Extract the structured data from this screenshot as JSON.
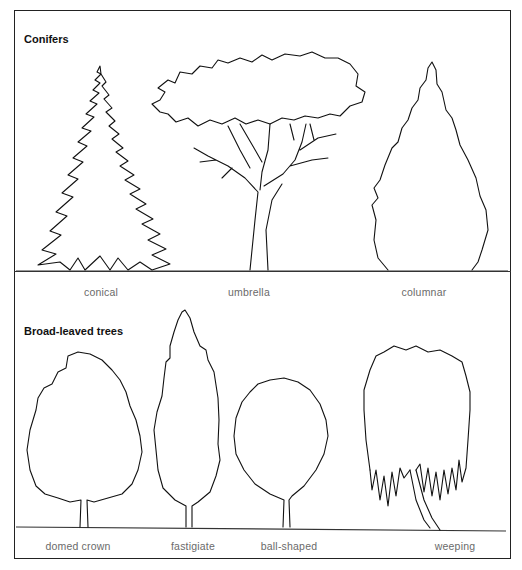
{
  "figure": {
    "sections": [
      {
        "title": "Conifers",
        "trees": [
          {
            "id": "conical",
            "label": "conical"
          },
          {
            "id": "umbrella",
            "label": "umbrella"
          },
          {
            "id": "columnar",
            "label": "columnar"
          }
        ]
      },
      {
        "title": "Broad-leaved trees",
        "trees": [
          {
            "id": "domed-crown",
            "label": "domed crown"
          },
          {
            "id": "fastigiate",
            "label": "fastigiate"
          },
          {
            "id": "ball-shaped",
            "label": "ball-shaped"
          },
          {
            "id": "weeping",
            "label": "weeping"
          }
        ]
      }
    ],
    "colors": {
      "line": "#111111",
      "caption": "#6a6a6a",
      "background": "#ffffff"
    }
  }
}
